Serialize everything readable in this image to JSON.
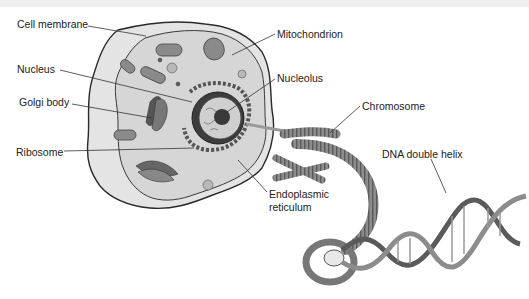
{
  "diagram": {
    "colors": {
      "outline": "#2a2a2a",
      "cytoplasm": "#d8d8d8",
      "membrane_fill": "#e6e6e6",
      "organelle": "#8a8a8a",
      "dark": "#4a4a4a",
      "leader": "#333333",
      "text": "#222222"
    },
    "labels": {
      "cell_membrane": "Cell membrane",
      "nucleus": "Nucleus",
      "golgi_body": "Golgi body",
      "ribosome": "Ribosome",
      "mitochondrion": "Mitochondrion",
      "nucleolus": "Nucleolus",
      "chromosome": "Chromosome",
      "endoplasmic_reticulum_line1": "Endoplasmic",
      "endoplasmic_reticulum_line2": "reticulum",
      "dna_double_helix": "DNA double helix"
    }
  }
}
